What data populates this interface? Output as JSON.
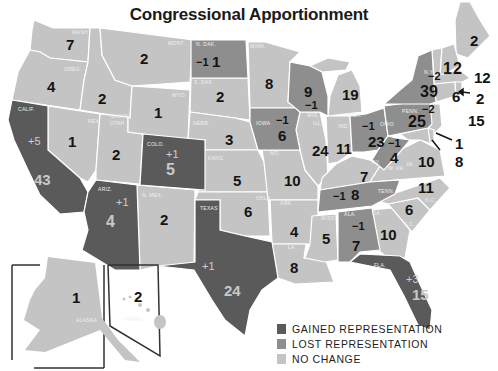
{
  "title": "Congressional Apportionment",
  "colors": {
    "gained": "#5a5a5a",
    "lost": "#8e8e8e",
    "no_change": "#c4c4c4",
    "border": "#ffffff",
    "background": "#ffffff"
  },
  "legend": [
    {
      "category": "gained",
      "label": "GAINED REPRESENTATION"
    },
    {
      "category": "lost",
      "label": "LOST REPRESENTATION"
    },
    {
      "category": "no_change",
      "label": "NO CHANGE"
    }
  ],
  "states": [
    {
      "abbr": "WASH.",
      "seats": "7",
      "change": "",
      "category": "no_change"
    },
    {
      "abbr": "OREG.",
      "seats": "4",
      "change": "",
      "category": "no_change"
    },
    {
      "abbr": "CALIF.",
      "seats": "43",
      "change": "+5",
      "category": "gained"
    },
    {
      "abbr": "IDAHO",
      "seats": "2",
      "change": "",
      "category": "no_change"
    },
    {
      "abbr": "NEV.",
      "seats": "1",
      "change": "",
      "category": "no_change"
    },
    {
      "abbr": "MONT.",
      "seats": "2",
      "change": "",
      "category": "no_change"
    },
    {
      "abbr": "WYO.",
      "seats": "1",
      "change": "",
      "category": "no_change"
    },
    {
      "abbr": "UTAH",
      "seats": "2",
      "change": "",
      "category": "no_change"
    },
    {
      "abbr": "COLO.",
      "seats": "5",
      "change": "+1",
      "category": "gained"
    },
    {
      "abbr": "ARIZ.",
      "seats": "4",
      "change": "+1",
      "category": "gained"
    },
    {
      "abbr": "N. MEX.",
      "seats": "2",
      "change": "",
      "category": "no_change"
    },
    {
      "abbr": "N. DAK.",
      "seats": "1",
      "change": "−1",
      "category": "lost"
    },
    {
      "abbr": "S. DAK.",
      "seats": "2",
      "change": "",
      "category": "no_change"
    },
    {
      "abbr": "NEBR.",
      "seats": "3",
      "change": "",
      "category": "no_change"
    },
    {
      "abbr": "KANS.",
      "seats": "5",
      "change": "",
      "category": "no_change"
    },
    {
      "abbr": "OKLA.",
      "seats": "6",
      "change": "",
      "category": "no_change"
    },
    {
      "abbr": "TEXAS",
      "seats": "24",
      "change": "+1",
      "category": "gained"
    },
    {
      "abbr": "MINN.",
      "seats": "8",
      "change": "",
      "category": "no_change"
    },
    {
      "abbr": "IOWA",
      "seats": "6",
      "change": "−1",
      "category": "lost"
    },
    {
      "abbr": "MO.",
      "seats": "10",
      "change": "",
      "category": "no_change"
    },
    {
      "abbr": "ARK.",
      "seats": "4",
      "change": "",
      "category": "no_change"
    },
    {
      "abbr": "LA.",
      "seats": "8",
      "change": "",
      "category": "no_change"
    },
    {
      "abbr": "WIS.",
      "seats": "9",
      "change": "−1",
      "category": "lost"
    },
    {
      "abbr": "ILL.",
      "seats": "24",
      "change": "",
      "category": "no_change"
    },
    {
      "abbr": "MICH.",
      "seats": "19",
      "change": "",
      "category": "no_change"
    },
    {
      "abbr": "IND.",
      "seats": "11",
      "change": "",
      "category": "no_change"
    },
    {
      "abbr": "OHIO",
      "seats": "23",
      "change": "−1",
      "category": "lost"
    },
    {
      "abbr": "KY.",
      "seats": "7",
      "change": "",
      "category": "no_change"
    },
    {
      "abbr": "TENN.",
      "seats": "8",
      "change": "−1",
      "category": "lost"
    },
    {
      "abbr": "MISS.",
      "seats": "5",
      "change": "",
      "category": "no_change"
    },
    {
      "abbr": "ALA.",
      "seats": "7",
      "change": "−1",
      "category": "lost"
    },
    {
      "abbr": "GA.",
      "seats": "10",
      "change": "",
      "category": "no_change"
    },
    {
      "abbr": "FLA.",
      "seats": "15",
      "change": "+3",
      "category": "gained"
    },
    {
      "abbr": "S.C.",
      "seats": "6",
      "change": "",
      "category": "no_change"
    },
    {
      "abbr": "N.C.",
      "seats": "11",
      "change": "",
      "category": "no_change"
    },
    {
      "abbr": "VA.",
      "seats": "10",
      "change": "",
      "category": "no_change"
    },
    {
      "abbr": "W. VA.",
      "seats": "4",
      "change": "−1",
      "category": "lost"
    },
    {
      "abbr": "PENN.",
      "seats": "25",
      "change": "−2",
      "category": "lost"
    },
    {
      "abbr": "N.Y.",
      "seats": "39",
      "change": "−2",
      "category": "lost"
    },
    {
      "abbr": "VT.",
      "seats": "1",
      "change": "",
      "category": "no_change"
    },
    {
      "abbr": "N.H.",
      "seats": "2",
      "change": "",
      "category": "no_change"
    },
    {
      "abbr": "ME.",
      "seats": "2",
      "change": "",
      "category": "no_change"
    },
    {
      "abbr": "MASS.",
      "seats": "12",
      "change": "",
      "category": "no_change"
    },
    {
      "abbr": "CONN.",
      "seats": "6",
      "change": "",
      "category": "no_change"
    },
    {
      "abbr": "R.I.",
      "seats": "2",
      "change": "",
      "category": "no_change"
    },
    {
      "abbr": "N.J.",
      "seats": "15",
      "change": "",
      "category": "no_change"
    },
    {
      "abbr": "DEL.",
      "seats": "1",
      "change": "",
      "category": "no_change"
    },
    {
      "abbr": "MD.",
      "seats": "8",
      "change": "",
      "category": "no_change"
    },
    {
      "abbr": "ALASKA",
      "seats": "1",
      "change": "",
      "category": "no_change"
    },
    {
      "abbr": "HAWAII",
      "seats": "2",
      "change": "",
      "category": "no_change"
    }
  ]
}
